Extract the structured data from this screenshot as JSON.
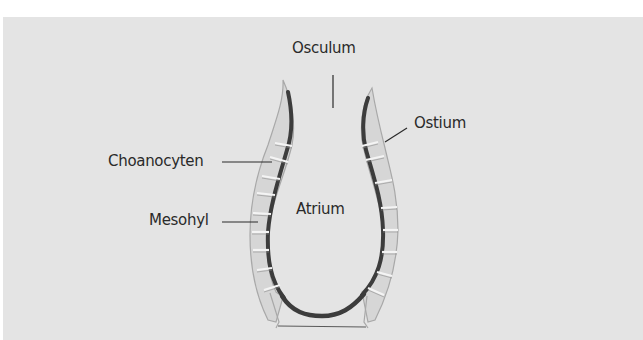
{
  "diagram": {
    "labels": {
      "osculum": "Osculum",
      "ostium": "Ostium",
      "choanocyten": "Choanocyten",
      "mesohyl": "Mesohyl",
      "atrium": "Atrium"
    },
    "colors": {
      "background": "#e4e4e4",
      "page": "#ffffff",
      "cell_fill": "#dcdcdc",
      "cell_outline": "#f2f2f2",
      "choanocyte_layer": "#3c3c3c",
      "outer_edge": "#9a9a9a",
      "leader_line": "#2a2a2a",
      "text": "#2a2a2a"
    }
  }
}
